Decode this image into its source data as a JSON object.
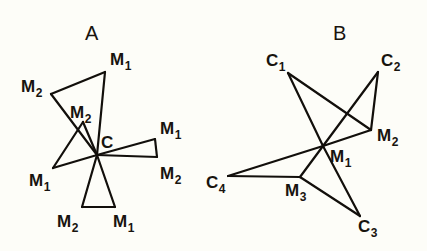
{
  "figure": {
    "background_color": "#fdfdf8",
    "line_color": "#120f0b",
    "text_color": "#18140f"
  },
  "panels": [
    {
      "id": "panel-a",
      "title": "A",
      "title_pos": {
        "x": 85,
        "y": 40
      },
      "center_label": "C",
      "vertices": [
        {
          "name": "center-c",
          "label": "C",
          "sub": "",
          "x": 97,
          "y": 155,
          "label_x": 101,
          "label_y": 148
        },
        {
          "name": "m1-top",
          "label": "M",
          "sub": "1",
          "x": 105,
          "y": 72,
          "label_x": 110,
          "label_y": 65
        },
        {
          "name": "m2-upper-left",
          "label": "M",
          "sub": "2",
          "x": 51,
          "y": 94,
          "label_x": 21,
          "label_y": 92
        },
        {
          "name": "m2-inner",
          "label": "M",
          "sub": "2",
          "x": 83,
          "y": 122,
          "label_x": 70,
          "label_y": 118
        },
        {
          "name": "m1-lower-left",
          "label": "M",
          "sub": "1",
          "x": 53,
          "y": 168,
          "label_x": 29,
          "label_y": 186
        },
        {
          "name": "m1-right",
          "label": "M",
          "sub": "1",
          "x": 155,
          "y": 139,
          "label_x": 160,
          "label_y": 134
        },
        {
          "name": "m2-right",
          "label": "M",
          "sub": "2",
          "x": 157,
          "y": 157,
          "label_x": 160,
          "label_y": 179
        },
        {
          "name": "m2-bottom",
          "label": "M",
          "sub": "2",
          "x": 82,
          "y": 207,
          "label_x": 57,
          "label_y": 227
        },
        {
          "name": "m1-bottom",
          "label": "M",
          "sub": "1",
          "x": 115,
          "y": 207,
          "label_x": 113,
          "label_y": 227
        }
      ],
      "bonds": [
        {
          "from": "m2-upper-left",
          "to": "m1-top"
        },
        {
          "from": "m1-top",
          "to": "center-c"
        },
        {
          "from": "m2-upper-left",
          "to": "center-c"
        },
        {
          "from": "m2-inner",
          "to": "center-c"
        },
        {
          "from": "m2-inner",
          "to": "m1-lower-left"
        },
        {
          "from": "m1-lower-left",
          "to": "center-c"
        },
        {
          "from": "center-c",
          "to": "m1-right"
        },
        {
          "from": "m1-right",
          "to": "m2-right"
        },
        {
          "from": "center-c",
          "to": "m2-right"
        },
        {
          "from": "center-c",
          "to": "m2-bottom"
        },
        {
          "from": "center-c",
          "to": "m1-bottom"
        },
        {
          "from": "m2-bottom",
          "to": "m1-bottom"
        }
      ]
    },
    {
      "id": "panel-b",
      "title": "B",
      "title_pos": {
        "x": 333,
        "y": 40
      },
      "center_label": "M1",
      "vertices": [
        {
          "name": "m1-center",
          "label": "M",
          "sub": "1",
          "x": 323,
          "y": 146,
          "label_x": 330,
          "label_y": 162
        },
        {
          "name": "c1",
          "label": "C",
          "sub": "1",
          "x": 288,
          "y": 73,
          "label_x": 266,
          "label_y": 66
        },
        {
          "name": "c2",
          "label": "C",
          "sub": "2",
          "x": 378,
          "y": 72,
          "label_x": 381,
          "label_y": 66
        },
        {
          "name": "m2",
          "label": "M",
          "sub": "2",
          "x": 371,
          "y": 130,
          "label_x": 377,
          "label_y": 141
        },
        {
          "name": "c3",
          "label": "C",
          "sub": "3",
          "x": 360,
          "y": 216,
          "label_x": 358,
          "label_y": 232
        },
        {
          "name": "m3",
          "label": "M",
          "sub": "3",
          "x": 300,
          "y": 177,
          "label_x": 285,
          "label_y": 196
        },
        {
          "name": "c4",
          "label": "C",
          "sub": "4",
          "x": 228,
          "y": 176,
          "label_x": 206,
          "label_y": 188
        }
      ],
      "bonds": [
        {
          "from": "c1",
          "to": "m1-center"
        },
        {
          "from": "c1",
          "to": "m2"
        },
        {
          "from": "c2",
          "to": "m1-center"
        },
        {
          "from": "c2",
          "to": "m2"
        },
        {
          "from": "m1-center",
          "to": "m2"
        },
        {
          "from": "m1-center",
          "to": "c3"
        },
        {
          "from": "m1-center",
          "to": "m3"
        },
        {
          "from": "m1-center",
          "to": "c4"
        },
        {
          "from": "m3",
          "to": "c3"
        },
        {
          "from": "m3",
          "to": "c4"
        }
      ]
    }
  ]
}
